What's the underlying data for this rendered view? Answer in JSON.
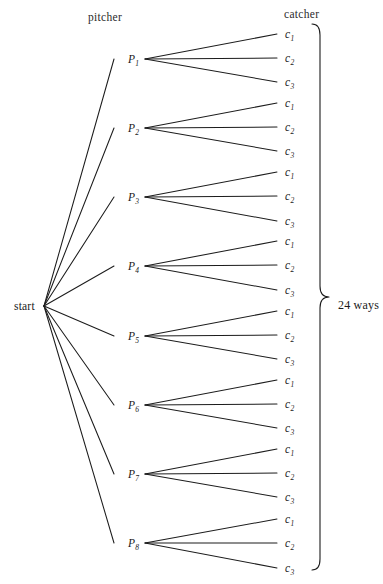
{
  "diagram": {
    "title": "",
    "type": "probability-tree-diagram",
    "width": 383,
    "height": 584,
    "background_color": "#ffffff",
    "line_color": "#1c1c1c",
    "text_color": "#1a1a1a"
  },
  "headers": {
    "pitcher": "pitcher",
    "catcher": "catcher"
  },
  "root": {
    "label": "start",
    "x": 44,
    "y": 306
  },
  "summary": {
    "label": "24 ways",
    "brace_top": 24,
    "brace_bottom": 570,
    "brace_x": 320,
    "label_x": 338,
    "label_y": 305
  },
  "pitcher_nodes": [
    {
      "letter": "P",
      "sub": "1",
      "label": "P1",
      "x": 128,
      "y": 59
    },
    {
      "letter": "P",
      "sub": "2",
      "label": "P2",
      "x": 128,
      "y": 128
    },
    {
      "letter": "P",
      "sub": "3",
      "label": "P3",
      "x": 128,
      "y": 197
    },
    {
      "letter": "P",
      "sub": "4",
      "label": "P4",
      "x": 128,
      "y": 266
    },
    {
      "letter": "P",
      "sub": "5",
      "label": "P5",
      "x": 128,
      "y": 336
    },
    {
      "letter": "P",
      "sub": "6",
      "label": "P6",
      "x": 128,
      "y": 405
    },
    {
      "letter": "P",
      "sub": "7",
      "label": "P7",
      "x": 128,
      "y": 474
    },
    {
      "letter": "P",
      "sub": "8",
      "label": "P8",
      "x": 128,
      "y": 543
    }
  ],
  "catcher_nodes": [
    {
      "letter": "c",
      "sub": "1",
      "label": "c1",
      "x": 285,
      "y": 34,
      "parent": 0
    },
    {
      "letter": "c",
      "sub": "2",
      "label": "c2",
      "x": 285,
      "y": 58,
      "parent": 0
    },
    {
      "letter": "c",
      "sub": "3",
      "label": "c3",
      "x": 285,
      "y": 82,
      "parent": 0
    },
    {
      "letter": "c",
      "sub": "1",
      "label": "c1",
      "x": 285,
      "y": 103,
      "parent": 1
    },
    {
      "letter": "c",
      "sub": "2",
      "label": "c2",
      "x": 285,
      "y": 127,
      "parent": 1
    },
    {
      "letter": "c",
      "sub": "3",
      "label": "c3",
      "x": 285,
      "y": 151,
      "parent": 1
    },
    {
      "letter": "c",
      "sub": "1",
      "label": "c1",
      "x": 285,
      "y": 172,
      "parent": 2
    },
    {
      "letter": "c",
      "sub": "2",
      "label": "c2",
      "x": 285,
      "y": 196,
      "parent": 2
    },
    {
      "letter": "c",
      "sub": "3",
      "label": "c3",
      "x": 285,
      "y": 221,
      "parent": 2
    },
    {
      "letter": "c",
      "sub": "1",
      "label": "c1",
      "x": 285,
      "y": 241,
      "parent": 3
    },
    {
      "letter": "c",
      "sub": "2",
      "label": "c2",
      "x": 285,
      "y": 265,
      "parent": 3
    },
    {
      "letter": "c",
      "sub": "3",
      "label": "c3",
      "x": 285,
      "y": 290,
      "parent": 3
    },
    {
      "letter": "c",
      "sub": "1",
      "label": "c1",
      "x": 285,
      "y": 311,
      "parent": 4
    },
    {
      "letter": "c",
      "sub": "2",
      "label": "c2",
      "x": 285,
      "y": 335,
      "parent": 4
    },
    {
      "letter": "c",
      "sub": "3",
      "label": "c3",
      "x": 285,
      "y": 359,
      "parent": 4
    },
    {
      "letter": "c",
      "sub": "1",
      "label": "c1",
      "x": 285,
      "y": 380,
      "parent": 5
    },
    {
      "letter": "c",
      "sub": "2",
      "label": "c2",
      "x": 285,
      "y": 404,
      "parent": 5
    },
    {
      "letter": "c",
      "sub": "3",
      "label": "c3",
      "x": 285,
      "y": 428,
      "parent": 5
    },
    {
      "letter": "c",
      "sub": "1",
      "label": "c1",
      "x": 285,
      "y": 449,
      "parent": 6
    },
    {
      "letter": "c",
      "sub": "2",
      "label": "c2",
      "x": 285,
      "y": 473,
      "parent": 6
    },
    {
      "letter": "c",
      "sub": "3",
      "label": "c3",
      "x": 285,
      "y": 497,
      "parent": 6
    },
    {
      "letter": "c",
      "sub": "1",
      "label": "c1",
      "x": 285,
      "y": 519,
      "parent": 7
    },
    {
      "letter": "c",
      "sub": "2",
      "label": "c2",
      "x": 285,
      "y": 543,
      "parent": 7
    },
    {
      "letter": "c",
      "sub": "3",
      "label": "c3",
      "x": 285,
      "y": 568,
      "parent": 7
    }
  ],
  "chart_data": {
    "type": "tree",
    "title": "",
    "levels": [
      "start",
      "pitcher",
      "catcher"
    ],
    "branching": [
      1,
      8,
      3
    ],
    "total_outcomes": 24,
    "total_label": "24 ways",
    "level1_labels": [
      "P1",
      "P2",
      "P3",
      "P4",
      "P5",
      "P6",
      "P7",
      "P8"
    ],
    "level2_labels": [
      "c1",
      "c2",
      "c3"
    ]
  }
}
